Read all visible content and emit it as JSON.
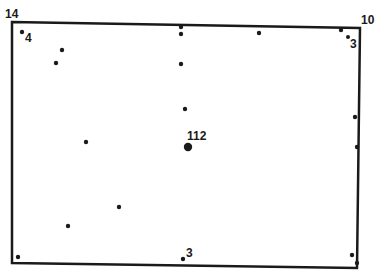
{
  "diagram": {
    "type": "point-distribution-rectangle",
    "frame": {
      "corners": {
        "tl": [
          12,
          22
        ],
        "tr": [
          360,
          28
        ],
        "br": [
          357,
          268
        ],
        "bl": [
          12,
          263
        ]
      },
      "stroke": "#1a1a1a",
      "stroke_width": 2.5
    },
    "corner_labels": [
      {
        "id": "top-left",
        "text": "14",
        "x": 5,
        "y": 18
      },
      {
        "id": "top-right",
        "text": "10",
        "x": 361,
        "y": 24
      }
    ],
    "points": [
      {
        "x": 22,
        "y": 32,
        "r": 2.2,
        "label": "4",
        "lx": 25,
        "ly": 42
      },
      {
        "x": 62,
        "y": 50,
        "r": 2.2
      },
      {
        "x": 56,
        "y": 63,
        "r": 2.2
      },
      {
        "x": 181,
        "y": 27,
        "r": 2.2
      },
      {
        "x": 181,
        "y": 34,
        "r": 2.2
      },
      {
        "x": 259,
        "y": 33,
        "r": 2.2
      },
      {
        "x": 341,
        "y": 30,
        "r": 2.2
      },
      {
        "x": 348,
        "y": 37,
        "r": 2.0,
        "label": "3",
        "lx": 350,
        "ly": 48
      },
      {
        "x": 181,
        "y": 64,
        "r": 2.2
      },
      {
        "x": 185,
        "y": 109,
        "r": 2.2
      },
      {
        "x": 188,
        "y": 147,
        "r": 4.2,
        "label": "112",
        "lx": 187,
        "ly": 140
      },
      {
        "x": 86,
        "y": 142,
        "r": 2.2
      },
      {
        "x": 355,
        "y": 117,
        "r": 2.2
      },
      {
        "x": 357,
        "y": 147,
        "r": 2.2
      },
      {
        "x": 119,
        "y": 207,
        "r": 2.2
      },
      {
        "x": 68,
        "y": 226,
        "r": 2.2
      },
      {
        "x": 18,
        "y": 257,
        "r": 2.2
      },
      {
        "x": 183,
        "y": 259,
        "r": 2.2,
        "label": "3",
        "lx": 186,
        "ly": 257
      },
      {
        "x": 352,
        "y": 255,
        "r": 2.2
      },
      {
        "x": 357,
        "y": 263,
        "r": 2.2
      }
    ],
    "point_color": "#1a1a1a",
    "label_color": "#1a1a1a"
  }
}
